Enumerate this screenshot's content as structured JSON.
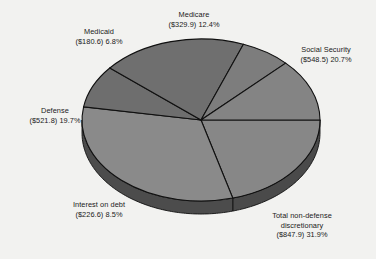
{
  "chart_data": {
    "type": "pie",
    "title": "",
    "subtitle": "",
    "xlabel": "",
    "ylabel": "",
    "grid": false,
    "legend_position": "none",
    "three_d": true,
    "start_angle_deg": 0,
    "direction": "clockwise",
    "value_prefix": "$",
    "value_unit": "billions",
    "categories": [
      "Social Security",
      "Total non-defense discretionary",
      "Interest on debt",
      "Defense",
      "Medicaid",
      "Medicare"
    ],
    "values": [
      548.5,
      847.9,
      226.6,
      521.8,
      180.6,
      329.9
    ],
    "percentages": [
      20.7,
      31.9,
      8.5,
      19.7,
      6.8,
      12.4
    ],
    "colors": [
      "#878787",
      "#8a8a8a",
      "#6e6e6e",
      "#6f6f6f",
      "#7d7d7d",
      "#848484"
    ],
    "slices": [
      {
        "name": "Social Security",
        "value": 548.5,
        "percent": 20.7,
        "color": "#878787",
        "label_lines": [
          "Social Security",
          "($548.5) 20.7%"
        ]
      },
      {
        "name": "Total non-defense discretionary",
        "value": 847.9,
        "percent": 31.9,
        "color": "#8a8a8a",
        "label_lines": [
          "Total non-defense",
          "discretionary",
          "($847.9) 31.9%"
        ]
      },
      {
        "name": "Interest on debt",
        "value": 226.6,
        "percent": 8.5,
        "color": "#6e6e6e",
        "label_lines": [
          "Interest on debt",
          "($226.6) 8.5%"
        ]
      },
      {
        "name": "Defense",
        "value": 521.8,
        "percent": 19.7,
        "color": "#6f6f6f",
        "label_lines": [
          "Defense",
          "($521.8) 19.7%"
        ]
      },
      {
        "name": "Medicaid",
        "value": 180.6,
        "percent": 6.8,
        "color": "#7d7d7d",
        "label_lines": [
          "Medicaid",
          "($180.6) 6.8%"
        ]
      },
      {
        "name": "Medicare",
        "value": 329.9,
        "percent": 12.4,
        "color": "#848484",
        "label_lines": [
          "Medicare",
          "($329.9) 12.4%"
        ]
      }
    ]
  },
  "labels": {
    "medicare": {
      "line1": "Medicare",
      "line2": "($329.9) 12.4%"
    },
    "social_security": {
      "line1": "Social Security",
      "line2": "($548.5) 20.7%"
    },
    "medicaid": {
      "line1": "Medicaid",
      "line2": "($180.6) 6.8%"
    },
    "defense": {
      "line1": "Defense",
      "line2": "($521.8) 19.7%"
    },
    "interest_on_debt": {
      "line1": "Interest on debt",
      "line2": "($226.6) 8.5%"
    },
    "non_defense_discretionary": {
      "line1": "Total non-defense",
      "line2": "discretionary",
      "line3": "($847.9) 31.9%"
    }
  },
  "style": {
    "background": "#f2f2f0",
    "outline": "#101010",
    "text": "#1a1a1a"
  }
}
